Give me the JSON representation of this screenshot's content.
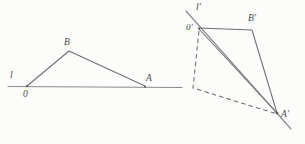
{
  "figure": {
    "title": "",
    "background_color": "#fcfcfb",
    "stroke_color": "#6e6e6e",
    "left_diagram": {
      "name": "original-triangle",
      "labels": {
        "line_label": "l",
        "origin_label": "0",
        "apex_label": "B",
        "right_label": "A"
      },
      "points": {
        "O": [
          27,
          86
        ],
        "B": [
          69,
          51
        ],
        "A": [
          145,
          86
        ]
      },
      "axis": {
        "x_start": 8,
        "x_end": 182,
        "y": 86
      }
    },
    "right_diagram": {
      "name": "transformed-triangle",
      "labels": {
        "line_label": "l'",
        "origin_label": "0'",
        "apex_label": "B'",
        "right_label": "A'"
      },
      "points": {
        "O_prime": [
          199,
          28
        ],
        "B_prime": [
          252,
          30
        ],
        "A_prime": [
          277,
          113
        ],
        "dashed_corner": [
          193,
          88
        ]
      },
      "axis": {
        "x_start": 186,
        "y_start": 10,
        "x_end": 292,
        "y_end": 130
      }
    }
  }
}
